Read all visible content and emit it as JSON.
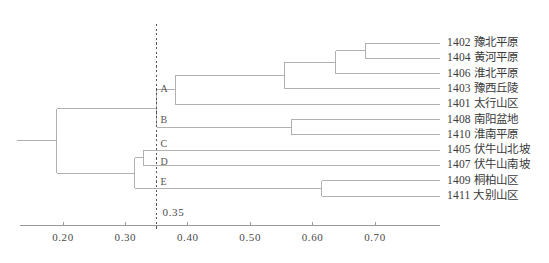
{
  "chart_data": {
    "type": "dendrogram",
    "title": "",
    "xlabel": "",
    "ylabel": "",
    "xlim": [
      0.155,
      0.725
    ],
    "grid": false,
    "legend": null,
    "orientation": "horizontal-left-to-right",
    "axis": {
      "ticks": [
        0.2,
        0.3,
        0.4,
        0.5,
        0.6,
        0.7
      ],
      "tick_labels": [
        "0.20",
        "0.30",
        "0.40",
        "0.50",
        "0.60",
        "0.70"
      ],
      "line_color": "#999999"
    },
    "cut_line": {
      "value": 0.35,
      "label": "0.35",
      "style": "dashed",
      "color": "#555555"
    },
    "leaves": [
      {
        "code": "1402",
        "name": "豫北平原",
        "label": "1402 豫北平原",
        "group": "A"
      },
      {
        "code": "1404",
        "name": "黄河平原",
        "label": "1404 黄河平原",
        "group": "A"
      },
      {
        "code": "1406",
        "name": "淮北平原",
        "label": "1406 淮北平原",
        "group": "A"
      },
      {
        "code": "1403",
        "name": "豫西丘陵",
        "label": "1403 豫西丘陵",
        "group": "A"
      },
      {
        "code": "1401",
        "name": "太行山区",
        "label": "1401 太行山区",
        "group": "A"
      },
      {
        "code": "1408",
        "name": "南阳盆地",
        "label": "1408 南阳盆地",
        "group": "B"
      },
      {
        "code": "1410",
        "name": "淮南平原",
        "label": "1410 淮南平原",
        "group": "B"
      },
      {
        "code": "1405",
        "name": "伏牛山北坡",
        "label": "1405 伏牛山北坡",
        "group": "C"
      },
      {
        "code": "1407",
        "name": "伏牛山南坡",
        "label": "1407 伏牛山南坡",
        "group": "D"
      },
      {
        "code": "1409",
        "name": "桐柏山区",
        "label": "1409 桐柏山区",
        "group": "E"
      },
      {
        "code": "1411",
        "name": "大别山区",
        "label": "1411 大别山区",
        "group": "E"
      }
    ],
    "groups": [
      {
        "letter": "A",
        "label": "A"
      },
      {
        "letter": "B",
        "label": "B"
      },
      {
        "letter": "C",
        "label": "C"
      },
      {
        "letter": "D",
        "label": "D"
      },
      {
        "letter": "E",
        "label": "E"
      }
    ],
    "merges": [
      {
        "id": "m1",
        "children": [
          "1402",
          "1404"
        ],
        "height": 0.684
      },
      {
        "id": "m2",
        "children": [
          "m1",
          "1406"
        ],
        "height": 0.637
      },
      {
        "id": "m3",
        "children": [
          "m2",
          "1403"
        ],
        "height": 0.555
      },
      {
        "id": "m4",
        "children": [
          "1408",
          "1410"
        ],
        "height": 0.566
      },
      {
        "id": "m5",
        "children": [
          "m3",
          "1401"
        ],
        "height": 0.38
      },
      {
        "id": "m6",
        "children": [
          "1409",
          "1411"
        ],
        "height": 0.615
      },
      {
        "id": "m7",
        "children": [
          "1405",
          "1407"
        ],
        "height": 0.329
      },
      {
        "id": "m8",
        "children": [
          "m5",
          "m4"
        ],
        "height": 0.35
      },
      {
        "id": "m9",
        "children": [
          "m7",
          "m6"
        ],
        "height": 0.315
      },
      {
        "id": "m10",
        "children": [
          "m8",
          "m9"
        ],
        "height": 0.19
      }
    ],
    "line_color": "#a8a8a8"
  }
}
